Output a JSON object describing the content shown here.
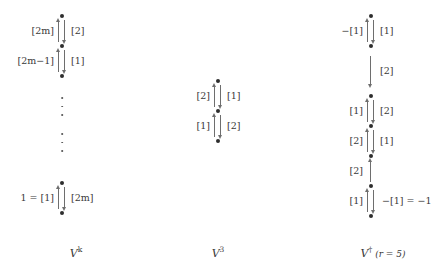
{
  "figure": {
    "background": "#ffffff",
    "ink": "#3a3a3a",
    "arrow_color": "#6e6e6e",
    "dot_color": "#2e2e2e"
  },
  "columns": [
    {
      "id": "col-vk",
      "caption_base": "V",
      "caption_sup": "k",
      "caption_suffix": "",
      "edges": [
        {
          "left": "[2m]",
          "right": "[2]"
        },
        {
          "left": "[2m−1]",
          "right": "[1]"
        },
        {
          "left": "1 = [1]",
          "right": "[2m]"
        }
      ],
      "ellipsis_groups": 2
    },
    {
      "id": "col-vs",
      "caption_base": "V",
      "caption_sup": "3",
      "caption_suffix": "",
      "edges": [
        {
          "left": "[2]",
          "right": "[1]"
        },
        {
          "left": "[1]",
          "right": "[2]"
        }
      ],
      "ellipsis_groups": 0
    },
    {
      "id": "col-vdagger",
      "caption_base": "V",
      "caption_sup": "†",
      "caption_suffix": "(r = 5)",
      "edges": [
        {
          "left": "−[1]",
          "right": "[1]"
        },
        {
          "left": "",
          "right": "[2]"
        },
        {
          "left": "[1]",
          "right": "[2]"
        },
        {
          "left": "[2]",
          "right": "[1]"
        },
        {
          "left": "[2]",
          "right": ""
        },
        {
          "left": "[1]",
          "right": "−[1] = −1"
        }
      ],
      "ellipsis_groups": 0
    }
  ]
}
